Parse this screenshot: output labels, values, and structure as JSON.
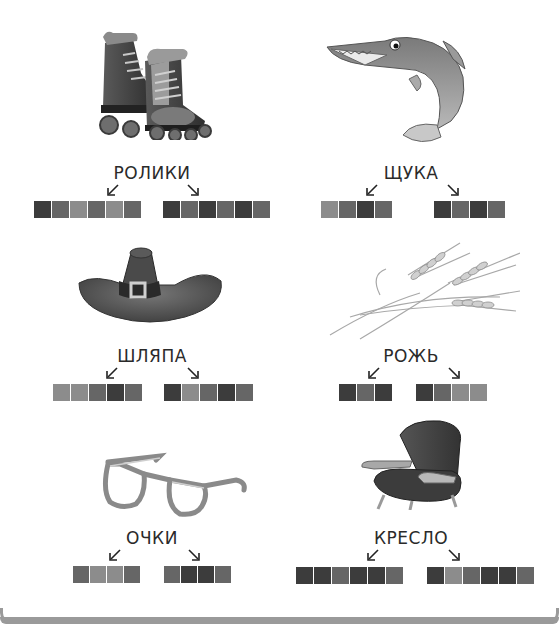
{
  "colors": {
    "dark": "#3c3c3c",
    "medium": "#666666",
    "light": "#8c8c8c",
    "text": "#2a2a2a"
  },
  "items": [
    {
      "word": "РОЛИКИ",
      "picture": "roller-skates",
      "left_blocks": [
        "D",
        "M",
        "L",
        "M",
        "L",
        "M"
      ],
      "right_blocks": [
        "D",
        "M",
        "D",
        "M",
        "D",
        "M"
      ]
    },
    {
      "word": "ЩУКА",
      "picture": "pike-fish",
      "left_blocks": [
        "L",
        "M",
        "D",
        "M"
      ],
      "right_blocks": [
        "D",
        "M",
        "D",
        "M"
      ]
    },
    {
      "word": "ШЛЯПА",
      "picture": "hat",
      "left_blocks": [
        "L",
        "L",
        "M",
        "D",
        "M"
      ],
      "right_blocks": [
        "D",
        "L",
        "M",
        "D",
        "M"
      ]
    },
    {
      "word": "РОЖЬ",
      "picture": "rye-ears",
      "left_blocks": [
        "D",
        "M",
        "D"
      ],
      "right_blocks": [
        "D",
        "M",
        "L",
        "L"
      ]
    },
    {
      "word": "ОЧКИ",
      "picture": "glasses",
      "left_blocks": [
        "M",
        "L",
        "L",
        "M"
      ],
      "right_blocks": [
        "M",
        "D",
        "D",
        "M"
      ]
    },
    {
      "word": "КРЕСЛО",
      "picture": "armchair",
      "left_blocks": [
        "D",
        "D",
        "M",
        "D",
        "D",
        "M"
      ],
      "right_blocks": [
        "D",
        "L",
        "M",
        "D",
        "D",
        "M"
      ]
    }
  ]
}
